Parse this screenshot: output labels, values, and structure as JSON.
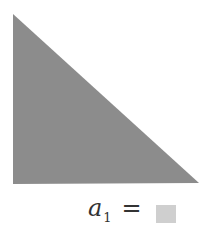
{
  "figure": {
    "shape": "right-triangle",
    "fill_color": "#8c8c8c",
    "points": [
      [
        13,
        14
      ],
      [
        13,
        184
      ],
      [
        199,
        183
      ]
    ]
  },
  "equation": {
    "variable": "a",
    "subscript": "1",
    "operator": "=",
    "value_swatch_color": "#cfcfcf"
  }
}
